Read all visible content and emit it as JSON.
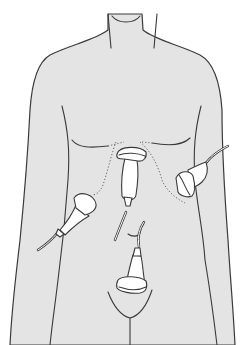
{
  "figure": {
    "colors": {
      "skin": "#e4e4e4",
      "outline": "#3a3a3a",
      "probe": "#ffffff",
      "background": "#ffffff"
    },
    "probes": [
      {
        "id": "subxiphoid",
        "position": "epigastric / subxiphoid, below sternum"
      },
      {
        "id": "right-upper-quadrant",
        "position": "right flank, patient's right (image left)"
      },
      {
        "id": "left-upper-quadrant",
        "position": "left flank, patient's left (image right)"
      },
      {
        "id": "suprapubic",
        "position": "lower abdomen, above pubis"
      }
    ],
    "landmarks": [
      "neck",
      "shoulders",
      "arms",
      "pectoral lines",
      "costal margin (dotted)",
      "umbilicus",
      "pubic line"
    ]
  }
}
